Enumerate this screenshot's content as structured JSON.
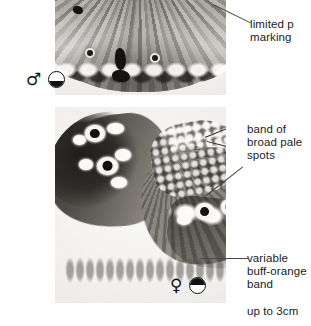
{
  "plate": {
    "title": "butterfly identification plate",
    "size_note": "up to 3cm"
  },
  "panels": [
    {
      "id": "male-specimen",
      "caption": "cropped hindwing of male specimen",
      "sex_symbol": "♂",
      "season_symbol": "half-filled circle (lower half dark)",
      "season_fill": "bottom"
    },
    {
      "id": "female-specimen",
      "caption": "full female specimen, upperside",
      "sex_symbol": "♀",
      "season_symbol": "half-filled circle (upper half dark)",
      "season_fill": "top"
    }
  ],
  "annotations": [
    {
      "id": "limited-pale-markings",
      "text": "limited p\nmarking"
    },
    {
      "id": "band-of-broad-pale-spots",
      "text": "band of\nbroad pale\nspots"
    },
    {
      "id": "variable-buff-orange-band",
      "text": "variable\nbuff-orange\nband"
    }
  ],
  "colors": {
    "page_background": "#ffffff",
    "photo_background": "#f2f2f1",
    "text": "#1b1b1b",
    "leader_line": "#4a4a4a"
  }
}
